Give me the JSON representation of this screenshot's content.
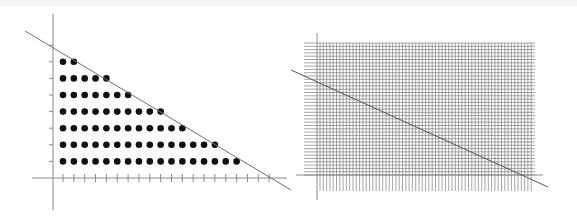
{
  "figure": {
    "colors": {
      "axis": "#888888",
      "line": "#666666",
      "dot": "#111111",
      "grid": "#6a6a6a",
      "background": "#ffffff"
    }
  },
  "left_panel": {
    "title": "",
    "dot_rows_counts_top_to_bottom": [
      2,
      5,
      7,
      10,
      12,
      15,
      17
    ],
    "dot_rows": 7,
    "x_tick_count": 20,
    "y_tick_count": 7,
    "line": {
      "from": [
        25,
        31
      ],
      "to": [
        291,
        190
      ]
    }
  },
  "right_panel": {
    "title": "",
    "grid_spacing_px": 3.3,
    "line": {
      "from": [
        291,
        70
      ],
      "to": [
        548,
        187
      ]
    }
  }
}
